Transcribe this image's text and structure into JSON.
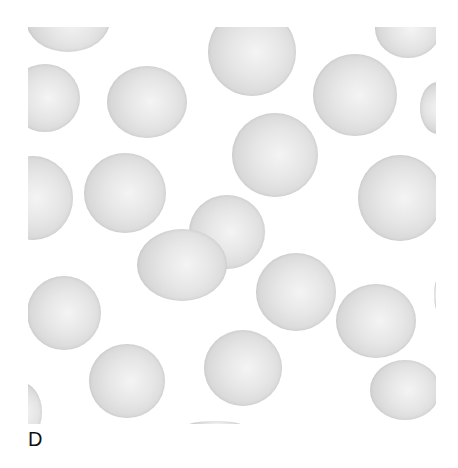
{
  "figure": {
    "panel_label": "D",
    "colors": {
      "background": "#ffffff",
      "cell_rim": "#c9c9c9",
      "cell_center": "#f4f4f4",
      "label": "#111111"
    },
    "cells": [
      {
        "cx": 40,
        "cy": -7,
        "rx": 42,
        "ry": 32
      },
      {
        "cx": 224,
        "cy": 25,
        "rx": 44,
        "ry": 44
      },
      {
        "cx": 380,
        "cy": 1,
        "rx": 33,
        "ry": 30
      },
      {
        "cx": 17,
        "cy": 71,
        "rx": 35,
        "ry": 34
      },
      {
        "cx": 119,
        "cy": 75,
        "rx": 40,
        "ry": 36
      },
      {
        "cx": 327,
        "cy": 68,
        "rx": 42,
        "ry": 41
      },
      {
        "cx": 410,
        "cy": 81,
        "rx": 18,
        "ry": 26
      },
      {
        "cx": 247,
        "cy": 128,
        "rx": 43,
        "ry": 42
      },
      {
        "cx": 5,
        "cy": 171,
        "rx": 40,
        "ry": 42
      },
      {
        "cx": 97,
        "cy": 166,
        "rx": 41,
        "ry": 40
      },
      {
        "cx": 372,
        "cy": 171,
        "rx": 42,
        "ry": 43
      },
      {
        "cx": 199,
        "cy": 205,
        "rx": 38,
        "ry": 37
      },
      {
        "cx": 154,
        "cy": 238,
        "rx": 45,
        "ry": 36
      },
      {
        "cx": 268,
        "cy": 265,
        "rx": 40,
        "ry": 39
      },
      {
        "cx": 36,
        "cy": 286,
        "rx": 37,
        "ry": 37
      },
      {
        "cx": 348,
        "cy": 294,
        "rx": 40,
        "ry": 37
      },
      {
        "cx": 99,
        "cy": 354,
        "rx": 38,
        "ry": 37
      },
      {
        "cx": 215,
        "cy": 341,
        "rx": 39,
        "ry": 38
      },
      {
        "cx": 377,
        "cy": 363,
        "rx": 35,
        "ry": 30
      },
      {
        "cx": -8,
        "cy": 385,
        "rx": 22,
        "ry": 30
      },
      {
        "cx": 187,
        "cy": 400,
        "rx": 30,
        "ry": 6
      },
      {
        "cx": 410,
        "cy": 268,
        "rx": 4,
        "ry": 16
      }
    ]
  }
}
